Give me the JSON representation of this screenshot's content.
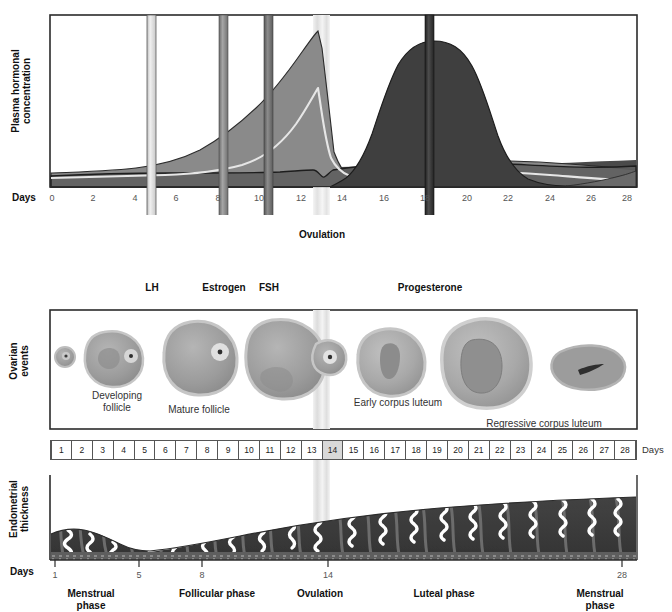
{
  "figure": {
    "colors": {
      "fsh": "#6e6e6e",
      "lh": "#d9d9d9",
      "estrogen": "#8a8a8a",
      "progesterone": "#4a4a4a",
      "baseline_band": "#4a4a4a",
      "ovulation_band": "#e2e2e2",
      "frame": "#2b2b2b",
      "endometrium_dark": "#3d3d3d",
      "endometrium_mid": "#6f6f6f",
      "follicle_fill": "#9a9a9a",
      "follicle_edge": "#c9c9c9"
    }
  },
  "hormone_panel": {
    "y_axis_label": "Plasma hormonal\nconcentration",
    "y_axis_label_line1": "Plasma hormonal",
    "y_axis_label_line2": "concentration",
    "days_word": "Days",
    "tick_labels": [
      "0",
      "2",
      "4",
      "6",
      "8",
      "10",
      "12",
      "14",
      "16",
      "18",
      "20",
      "22",
      "24",
      "26",
      "28"
    ],
    "ovulation_label": "Ovulation",
    "arrows": [
      {
        "name": "LH",
        "label": "LH",
        "day": 5.5,
        "color": "#d9d9d9"
      },
      {
        "name": "Estrogen",
        "label": "Estrogen",
        "day": 9.0,
        "color": "#8a8a8a"
      },
      {
        "name": "FSH",
        "label": "FSH",
        "day": 11.2,
        "color": "#6e6e6e"
      },
      {
        "name": "Progesterone",
        "label": "Progesterone",
        "day": 19.0,
        "color": "#3a3a3a"
      }
    ]
  },
  "ovarian_panel": {
    "y_axis_label_line1": "Ovarian",
    "y_axis_label_line2": "events",
    "stage_labels": [
      {
        "name": "developing-follicle",
        "line1": "Developing",
        "line2": "follicle"
      },
      {
        "name": "mature-follicle",
        "line1": "Mature follicle",
        "line2": ""
      },
      {
        "name": "early-corpus-luteum",
        "line1": "Early corpus luteum",
        "line2": ""
      },
      {
        "name": "regressive-corpus-luteum",
        "line1": "Regressive corpus luteum",
        "line2": ""
      }
    ]
  },
  "day_strip": {
    "days": [
      "1",
      "2",
      "3",
      "4",
      "5",
      "6",
      "7",
      "8",
      "9",
      "10",
      "11",
      "12",
      "13",
      "14",
      "15",
      "16",
      "17",
      "18",
      "19",
      "20",
      "21",
      "22",
      "23",
      "24",
      "25",
      "26",
      "27",
      "28"
    ],
    "highlight_day": "14",
    "trailing_label": "Days"
  },
  "endometrial_panel": {
    "y_axis_label_line1": "Endometrial",
    "y_axis_label_line2": "thickness",
    "days_word": "Days",
    "tick_labels": [
      "1",
      "5",
      "8",
      "14",
      "28"
    ],
    "tick_days": [
      1,
      5,
      8,
      14,
      28
    ],
    "phases": [
      {
        "name": "menstrual-phase-early",
        "line1": "Menstrual",
        "line2": "phase",
        "day": 2.5
      },
      {
        "name": "follicular-phase",
        "line1": "Follicular phase",
        "line2": "",
        "day": 10.0
      },
      {
        "name": "ovulation",
        "line1": "Ovulation",
        "line2": "",
        "day": 14.4
      },
      {
        "name": "luteal-phase",
        "line1": "Luteal phase",
        "line2": "",
        "day": 20.5
      },
      {
        "name": "menstrual-phase-late",
        "line1": "Menstrual",
        "line2": "phase",
        "day": 26.5
      }
    ]
  },
  "chart_data": {
    "type": "area",
    "xlabel": "Days",
    "ylabel": "Plasma hormonal concentration",
    "xlim": [
      0,
      28
    ],
    "ylim": [
      0,
      100
    ],
    "grid": false,
    "legend": "arrow callouts below axis",
    "annotations": [
      {
        "text": "Ovulation",
        "day": 14
      },
      {
        "text": "LH",
        "day": 5.5
      },
      {
        "text": "Estrogen",
        "day": 9.0
      },
      {
        "text": "FSH",
        "day": 11.2
      },
      {
        "text": "Progesterone",
        "day": 19.0
      }
    ],
    "x": [
      0,
      1,
      2,
      3,
      4,
      5,
      6,
      7,
      8,
      9,
      10,
      11,
      12,
      13,
      13.6,
      14,
      14.4,
      15,
      16,
      17,
      18,
      19,
      20,
      21,
      22,
      23,
      24,
      25,
      26,
      27,
      28
    ],
    "series": [
      {
        "name": "FSH",
        "color": "#6e6e6e",
        "values": [
          17,
          17,
          17,
          17,
          17,
          16,
          15,
          14,
          13,
          13,
          13,
          14,
          16,
          18,
          19,
          18,
          15,
          12,
          11,
          11,
          11,
          11,
          11,
          11,
          11,
          12,
          13,
          15,
          17,
          19,
          21
        ]
      },
      {
        "name": "LH",
        "color": "#d9d9d9",
        "values": [
          12,
          12,
          12,
          12,
          12,
          12,
          12,
          13,
          14,
          16,
          20,
          28,
          42,
          64,
          70,
          55,
          28,
          14,
          11,
          10,
          10,
          10,
          10,
          10,
          10,
          10,
          10,
          10,
          10,
          11,
          12
        ]
      },
      {
        "name": "Estrogen",
        "color": "#8a8a8a",
        "values": [
          13,
          13,
          13,
          14,
          15,
          16,
          18,
          22,
          28,
          35,
          44,
          55,
          70,
          86,
          92,
          78,
          40,
          22,
          24,
          28,
          31,
          33,
          34,
          34,
          33,
          31,
          28,
          24,
          20,
          17,
          15
        ]
      },
      {
        "name": "Progesterone",
        "color": "#4a4a4a",
        "values": [
          8,
          8,
          8,
          8,
          8,
          8,
          8,
          8,
          8,
          8,
          8,
          8,
          9,
          10,
          10,
          11,
          14,
          26,
          48,
          68,
          83,
          91,
          93,
          90,
          82,
          70,
          55,
          40,
          27,
          18,
          12
        ]
      }
    ]
  }
}
